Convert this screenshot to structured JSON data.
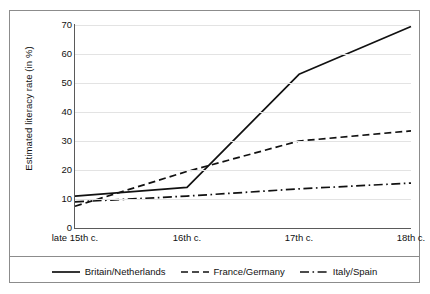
{
  "chart_data": {
    "type": "line",
    "title": "",
    "xlabel": "",
    "ylabel": "Estimated literacy rate (in %)",
    "categories": [
      "late 15th c.",
      "16th c.",
      "17th c.",
      "18th c."
    ],
    "ylim": [
      0,
      70
    ],
    "yticks": [
      0,
      10,
      20,
      30,
      40,
      50,
      60,
      70
    ],
    "ytick_labels": [
      "0",
      "10",
      "20",
      "30",
      "40",
      "50",
      "60",
      "70"
    ],
    "grid": "horizontal",
    "legend_position": "bottom",
    "series": [
      {
        "name": "Britain/Netherlands",
        "line_style": "solid",
        "color": "#111111",
        "values": [
          11,
          14,
          53,
          69.5
        ]
      },
      {
        "name": "France/Germany",
        "line_style": "dashed",
        "color": "#111111",
        "values": [
          7.5,
          19.5,
          30,
          33.5
        ]
      },
      {
        "name": "Italy/Spain",
        "line_style": "dash-dot",
        "color": "#111111",
        "values": [
          9,
          11,
          13.5,
          15.5
        ]
      }
    ]
  },
  "legend": {
    "items": [
      {
        "label": "Britain/Netherlands",
        "swatch": "solid-line-icon"
      },
      {
        "label": "France/Germany",
        "swatch": "dashed-line-icon"
      },
      {
        "label": "Italy/Spain",
        "swatch": "dash-dot-line-icon"
      }
    ]
  },
  "colors": {
    "frame_border": "#8c8c8c",
    "axis": "#5a5a5a",
    "gridline": "#e3e3e3",
    "series_ink": "#111111",
    "background": "#ffffff"
  }
}
